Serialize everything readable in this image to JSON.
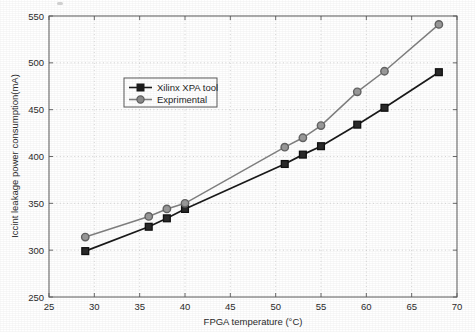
{
  "chart_data": {
    "type": "line",
    "title": "",
    "xlabel": "FPGA temperature (°C)",
    "ylabel": "Iccint leakage power consumption(mA)",
    "xlim": [
      25,
      70
    ],
    "ylim": [
      250,
      550
    ],
    "xticks": [
      25,
      30,
      35,
      40,
      45,
      50,
      55,
      60,
      65,
      70
    ],
    "yticks": [
      250,
      300,
      350,
      400,
      450,
      500,
      550
    ],
    "xtick_labels": [
      "25",
      "30",
      "35",
      "40",
      "45",
      "50",
      "55",
      "60",
      "65",
      "70"
    ],
    "ytick_labels": [
      "250",
      "300",
      "350",
      "400",
      "450",
      "500",
      "550"
    ],
    "grid": true,
    "legend_position": "upper-left-inside",
    "x": [
      29,
      36,
      38,
      40,
      51,
      53,
      55,
      59,
      62,
      68
    ],
    "series": [
      {
        "name": "Xilinx XPA tool",
        "marker": "square",
        "color": "#1a1a1a",
        "values": [
          299,
          325,
          334,
          344,
          392,
          402,
          411,
          434,
          452,
          490
        ]
      },
      {
        "name": "Exprimental",
        "marker": "circle",
        "color": "#808080",
        "values": [
          314,
          336,
          344,
          350,
          410,
          420,
          433,
          469,
          491,
          541
        ]
      }
    ]
  },
  "legend": {
    "entries": [
      {
        "label": "Xilinx XPA tool",
        "marker": "square-marker",
        "color": "#1a1a1a"
      },
      {
        "label": "Exprimental",
        "marker": "circle-marker",
        "color": "#808080"
      }
    ]
  },
  "colors": {
    "axis": "#4d4d4d",
    "grid": "#c9c9c9",
    "background": "#ffffff",
    "series_1": "#1a1a1a",
    "series_2": "#808080",
    "text": "#2b2b2b"
  }
}
